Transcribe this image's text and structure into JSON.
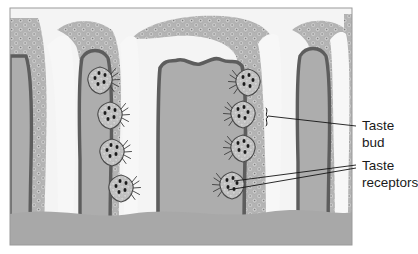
{
  "figure": {
    "kind": "histology-illustration",
    "panel": {
      "x": 10,
      "y": 8,
      "width": 342,
      "height": 237
    },
    "colors": {
      "page_background": "#ffffff",
      "panel_border": "#9a9a9a",
      "epithelium": "#b4b4b4",
      "epithelium_cell": "#c9c9c9",
      "epithelium_nucleus": "#8a8a8a",
      "connective_tissue": "#adadad",
      "basement_membrane": "#5d5d5d",
      "trench_lumen": "#f2f2f2",
      "taste_bud_body": "#c2c2c2",
      "taste_bud_outline": "#4a4a4a",
      "taste_receptor_cell": "#1f1f1f",
      "leader_line": "#141414",
      "label_text": "#1a1a1a"
    }
  },
  "labels": [
    {
      "id": "taste-bud",
      "lines": [
        "Taste",
        "bud"
      ],
      "text_x": 362,
      "text_y": [
        130,
        147
      ],
      "leader": {
        "x1": 356,
        "y1": 126,
        "x2": 268,
        "y2": 116
      },
      "bracket": {
        "x": 266,
        "y": 108,
        "height": 18
      }
    },
    {
      "id": "taste-receptors",
      "lines": [
        "Taste",
        "receptors"
      ],
      "text_x": 362,
      "text_y": [
        170,
        187
      ],
      "leaders": [
        {
          "x1": 356,
          "y1": 165,
          "x2": 234,
          "y2": 181
        },
        {
          "x1": 356,
          "y1": 168,
          "x2": 228,
          "y2": 190
        }
      ]
    }
  ],
  "taste_buds": [
    {
      "id": "bud-left-1",
      "cx": 100,
      "cy": 80,
      "side": "right",
      "receptors": 5
    },
    {
      "id": "bud-left-2",
      "cx": 110,
      "cy": 115,
      "side": "right",
      "receptors": 5
    },
    {
      "id": "bud-left-3",
      "cx": 112,
      "cy": 152,
      "side": "right",
      "receptors": 5
    },
    {
      "id": "bud-left-4",
      "cx": 121,
      "cy": 188,
      "side": "right",
      "receptors": 5
    },
    {
      "id": "bud-right-1",
      "cx": 248,
      "cy": 82,
      "side": "left",
      "receptors": 5
    },
    {
      "id": "bud-right-2",
      "cx": 243,
      "cy": 114,
      "side": "left",
      "receptors": 5
    },
    {
      "id": "bud-right-3",
      "cx": 243,
      "cy": 148,
      "side": "left",
      "receptors": 5
    },
    {
      "id": "bud-right-4",
      "cx": 232,
      "cy": 185,
      "side": "left",
      "receptors": 5
    }
  ]
}
